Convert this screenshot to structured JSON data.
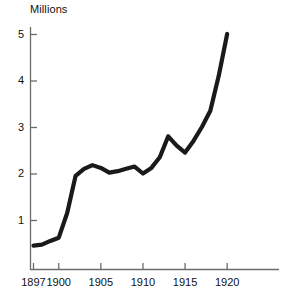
{
  "chart_data": {
    "type": "line",
    "title": "",
    "subtitle": "",
    "ylabel": "Millions",
    "xlabel": "",
    "axis_title_text": "Millions",
    "x": [
      1897,
      1898,
      1899,
      1900,
      1901,
      1902,
      1903,
      1904,
      1905,
      1906,
      1907,
      1908,
      1909,
      1910,
      1911,
      1912,
      1913,
      1914,
      1915,
      1916,
      1917,
      1918,
      1919,
      1920
    ],
    "values": [
      0.45,
      0.47,
      0.55,
      0.62,
      1.15,
      1.95,
      2.1,
      2.18,
      2.12,
      2.02,
      2.05,
      2.1,
      2.15,
      2.0,
      2.12,
      2.35,
      2.8,
      2.6,
      2.45,
      2.7,
      3.0,
      3.35,
      4.1,
      5.0
    ],
    "series": [
      {
        "name": "",
        "values": [
          0.45,
          0.47,
          0.55,
          0.62,
          1.15,
          1.95,
          2.1,
          2.18,
          2.12,
          2.02,
          2.05,
          2.1,
          2.15,
          2.0,
          2.12,
          2.35,
          2.8,
          2.6,
          2.45,
          2.7,
          3.0,
          3.35,
          4.1,
          5.0
        ]
      }
    ],
    "xlim": [
      1897,
      1922
    ],
    "ylim": [
      0,
      5.25
    ],
    "yticks": [
      1,
      2,
      3,
      4,
      5
    ],
    "ytick_labels": [
      "1",
      "2",
      "3",
      "4",
      "5"
    ],
    "xticks": [
      1897,
      1900,
      1905,
      1910,
      1915,
      1920
    ],
    "xtick_labels": [
      "1897",
      "1900",
      "1905",
      "1910",
      "1915",
      "1920"
    ],
    "grid": false,
    "legend": false,
    "legend_position": "none",
    "line_color": "#1a1a1a",
    "axis_color": "#6b6b6b",
    "background_color": "#ffffff"
  }
}
